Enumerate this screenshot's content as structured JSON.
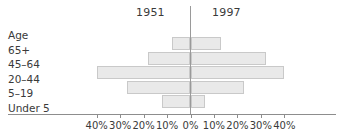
{
  "headings": {
    "left_year": "1951",
    "right_year": "1997"
  },
  "axis": {
    "age_header": "Age",
    "tick_labels": [
      "40%",
      "30%",
      "20%",
      "10%",
      "0%",
      "10%",
      "20%",
      "30%",
      "40%"
    ],
    "tick_values": [
      -40,
      -30,
      -20,
      -10,
      0,
      10,
      20,
      30,
      40
    ]
  },
  "colors": {
    "bar_fill": "#e9e9e9",
    "bar_border": "#c9c9c9",
    "axis_line": "#8d8d8d",
    "text": "#3a3a3a",
    "background": "#ffffff"
  },
  "chart_data": {
    "type": "bar",
    "title": "",
    "subtitle": "",
    "xlabel": "",
    "ylabel": "Age",
    "orientation": "horizontal",
    "layout": "population-pyramid",
    "grid": false,
    "legend_position": "top",
    "xlim": [
      -40,
      40
    ],
    "x_tick_interval": 10,
    "x_unit": "%",
    "categories": [
      "65+",
      "45–64",
      "20–44",
      "5–19",
      "Under 5"
    ],
    "series": [
      {
        "name": "1951",
        "side": "left",
        "values": [
          8,
          18,
          40,
          27,
          12
        ]
      },
      {
        "name": "1997",
        "side": "right",
        "values": [
          13,
          32,
          40,
          23,
          6
        ]
      }
    ],
    "rows": [
      {
        "category": "65+",
        "left": 8,
        "right": 13
      },
      {
        "category": "45–64",
        "left": 18,
        "right": 32
      },
      {
        "category": "20–44",
        "left": 40,
        "right": 40
      },
      {
        "category": "5–19",
        "left": 27,
        "right": 23
      },
      {
        "category": "Under 5",
        "left": 12,
        "right": 6
      }
    ]
  }
}
